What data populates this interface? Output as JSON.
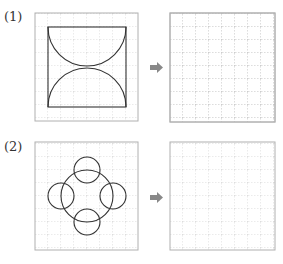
{
  "problems": [
    {
      "label": "(1)",
      "figure": "square with two semicircles meeting at center",
      "arrow": "right-arrow"
    },
    {
      "label": "(2)",
      "figure": "large circle with four small circles at top, right, bottom, left",
      "arrow": "right-arrow"
    }
  ],
  "colors": {
    "grid_line": "#bbbbbb",
    "box_border": "#b0b0b0",
    "figure_stroke": "#333333",
    "arrow": "#888888"
  }
}
